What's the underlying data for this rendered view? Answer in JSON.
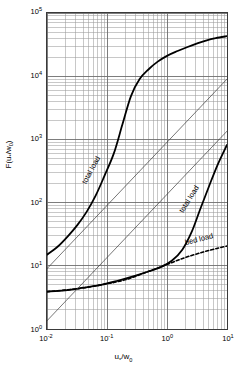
{
  "chart_data": {
    "type": "line",
    "title": "",
    "xlabel": "u*/w0",
    "xlabel_html": "u<sub>*</sub>/w<sub>0</sub>",
    "ylabel": "F(u*/w0)",
    "ylabel_html": "F(u<sub>*</sub>/w<sub>0</sub>)",
    "xscale": "log",
    "yscale": "log",
    "xlim": [
      0.01,
      10
    ],
    "ylim": [
      1,
      100000
    ],
    "grid": true,
    "grid_minor": true,
    "legend": "none",
    "xticks": [
      0.01,
      0.1,
      1,
      10
    ],
    "xtick_labels": [
      "10-2",
      "10-1",
      "100",
      "101"
    ],
    "xtick_mantissa": "10",
    "xtick_exponents": [
      "-2",
      "-1",
      "0",
      "1"
    ],
    "yticks": [
      1,
      10,
      100,
      1000,
      10000,
      100000
    ],
    "ytick_labels": [
      "100",
      "101",
      "102",
      "103",
      "104",
      "105"
    ],
    "ytick_exponents": [
      "0",
      "1",
      "2",
      "3",
      "4",
      "5"
    ],
    "series": [
      {
        "name": "total load (upper)",
        "label": "total load",
        "style": "solid",
        "color": "#000000",
        "width": 1.8,
        "x": [
          0.01,
          0.015,
          0.022,
          0.032,
          0.046,
          0.065,
          0.09,
          0.13,
          0.18,
          0.25,
          0.35,
          0.5,
          0.7,
          1.0,
          1.5,
          2.2,
          3.2,
          4.6,
          6.5,
          10.0
        ],
        "y": [
          15,
          20,
          29,
          44,
          72,
          130,
          260,
          600,
          1700,
          4800,
          9000,
          13000,
          17000,
          21000,
          25000,
          29000,
          33000,
          37000,
          40000,
          43000
        ]
      },
      {
        "name": "total load (lower)",
        "label": "total load",
        "style": "solid",
        "color": "#000000",
        "width": 1.8,
        "x": [
          0.01,
          0.02,
          0.04,
          0.08,
          0.15,
          0.3,
          0.5,
          0.8,
          1.2,
          1.8,
          2.6,
          3.6,
          5.0,
          7.0,
          10.0
        ],
        "y": [
          3.9,
          4.1,
          4.5,
          5.0,
          5.8,
          7.0,
          8.2,
          9.6,
          12,
          18,
          35,
          80,
          180,
          400,
          820
        ]
      },
      {
        "name": "bed load",
        "label": "bed load",
        "style": "dashed",
        "color": "#000000",
        "width": 1.6,
        "x": [
          0.01,
          0.03,
          0.08,
          0.2,
          0.5,
          1.0,
          2.0,
          4.0,
          7.0,
          10.0
        ],
        "y": [
          3.9,
          4.3,
          5.0,
          6.0,
          8.2,
          10.5,
          13.5,
          16.5,
          19,
          20.5
        ]
      },
      {
        "name": "reference band upper",
        "label": "",
        "style": "solid",
        "color": "#3a3a3a",
        "width": 0.7,
        "x": [
          0.01,
          10.0
        ],
        "y": [
          9.0,
          9000
        ]
      },
      {
        "name": "reference band lower",
        "label": "",
        "style": "solid",
        "color": "#3a3a3a",
        "width": 0.7,
        "x": [
          0.01,
          10.0
        ],
        "y": [
          1.35,
          1350
        ]
      }
    ],
    "annotations": [
      {
        "text": "total load",
        "x": 0.055,
        "y": 330,
        "rotation": -62
      },
      {
        "text": "total load",
        "x": 2.3,
        "y": 115,
        "rotation": -58
      },
      {
        "text": "bed load",
        "x": 3.3,
        "y": 27,
        "rotation": -14
      }
    ],
    "colors": {
      "grid_major": "#6e6e6e",
      "grid_minor": "#9a9a9a",
      "frame": "#3a3a3a",
      "curve": "#000000",
      "background": "#ffffff"
    }
  }
}
